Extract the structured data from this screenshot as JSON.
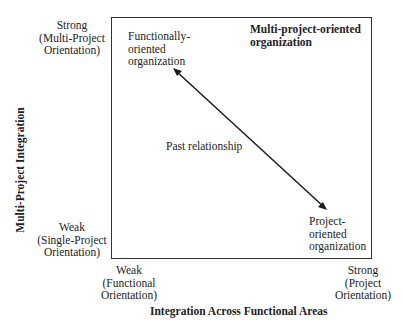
{
  "diagram": {
    "y_axis": {
      "title": "Multi-Project Integration",
      "high_label": [
        "Strong",
        "(Multi-Project",
        "Orientation)"
      ],
      "low_label": [
        "Weak",
        "(Single-Project",
        "Orientation)"
      ]
    },
    "x_axis": {
      "title": "Integration Across Functional Areas",
      "low_label": [
        "Weak",
        "(Functional",
        "Orientation)"
      ],
      "high_label": [
        "Strong",
        "(Project",
        "Orientation)"
      ]
    },
    "quadrant_labels": {
      "top_left": [
        "Functionally-",
        "oriented",
        "organization"
      ],
      "top_right": [
        "Multi-project-oriented",
        "organization"
      ],
      "bottom_right": [
        "Project-",
        "oriented",
        "organization"
      ]
    },
    "arrow": {
      "label": "Past relationship",
      "from": "Functionally-oriented organization",
      "to": "Project-oriented organization",
      "bidirectional": true
    }
  }
}
